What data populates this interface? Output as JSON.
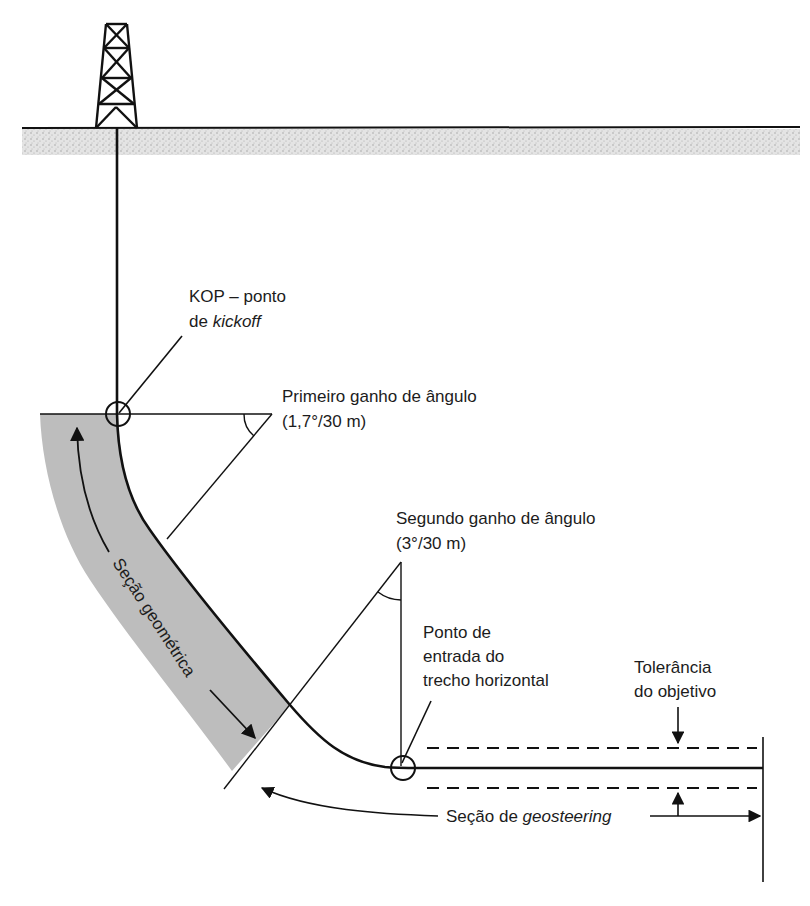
{
  "diagram": {
    "type": "directional-well-profile",
    "colors": {
      "line": "#111111",
      "geometric_section_fill": "#bdbdbd",
      "ground_stipple": "#d4d4d4",
      "background": "#ffffff"
    },
    "labels": {
      "kop_line1": "KOP – ponto",
      "kop_line2_prefix": "de ",
      "kop_line2_italic": "kickoff",
      "first_gain_line1": "Primeiro ganho de ângulo",
      "first_gain_line2": "(1,7°/30 m)",
      "second_gain_line1": "Segundo ganho de ângulo",
      "second_gain_line2": "(3°/30 m)",
      "entry_line1": "Ponto de",
      "entry_line2": "entrada do",
      "entry_line3": "trecho horizontal",
      "tolerance_line1": "Tolerância",
      "tolerance_line2": "do objetivo",
      "geometric_section": "Seção geométrica",
      "geosteering_prefix": "Seção de ",
      "geosteering_italic": "geosteering"
    },
    "elements": [
      "drilling-rig-icon",
      "ground-surface",
      "vertical-well-section",
      "kickoff-point",
      "first-build-angle",
      "second-build-angle",
      "horizontal-entry-point",
      "target-tolerance-band",
      "geometric-section-band",
      "geosteering-section"
    ]
  }
}
